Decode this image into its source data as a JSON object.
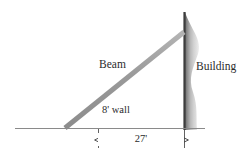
{
  "figure": {
    "background_color": "#ffffff",
    "width": 248,
    "height": 158
  },
  "labels": {
    "beam": "Beam",
    "building": "Building",
    "wall": "8' wall",
    "distance": "27'"
  },
  "colors": {
    "beam": "#9a9a9a",
    "wall": "#9c9c9c",
    "ground": "#8a8a8a",
    "building_edge": "#3d3d3d",
    "building_fill_dark": "#6e6e6e",
    "building_fill_light": "#e4e4e4",
    "dimension": "#3a3a3a",
    "text": "#2b2b2b"
  },
  "geometry": {
    "ground_line": {
      "x1": 15,
      "y1": 128,
      "x2": 205,
      "y2": 128
    },
    "beam": {
      "x1": 65,
      "y1": 128,
      "x2": 184,
      "y2": 32,
      "thickness": 5
    },
    "wall_post": {
      "x": 98,
      "y_top": 98,
      "y_bottom": 128,
      "thickness": 3
    },
    "building_edge": {
      "x": 184,
      "y_top": 12,
      "y_bottom": 130
    },
    "building_column": {
      "x": 185,
      "y_top": 12,
      "width": 18,
      "height": 118
    },
    "dimension_line": {
      "y": 140,
      "x_left": 98,
      "x_right": 184
    },
    "extension_left": {
      "x": 98,
      "y_top": 129,
      "y_bottom": 148
    },
    "extension_right": {
      "x": 184,
      "y_top": 129,
      "y_bottom": 148
    }
  },
  "measurements": {
    "wall_height_feet": 8,
    "ground_distance_feet": 27
  }
}
